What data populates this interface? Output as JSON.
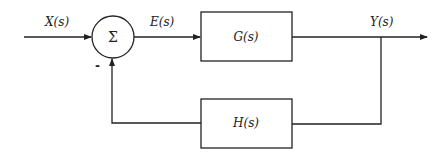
{
  "diagram": {
    "type": "negative feedback control loop block diagram",
    "signals": {
      "input": "X(s)",
      "error": "E(s)",
      "output": "Y(s)"
    },
    "blocks": {
      "forward": "G(s)",
      "feedback": "H(s)"
    },
    "summing_junction": {
      "symbol": "Σ",
      "feedback_sign": "-"
    },
    "colors": {
      "line": "#222222",
      "background": "#ffffff"
    }
  }
}
